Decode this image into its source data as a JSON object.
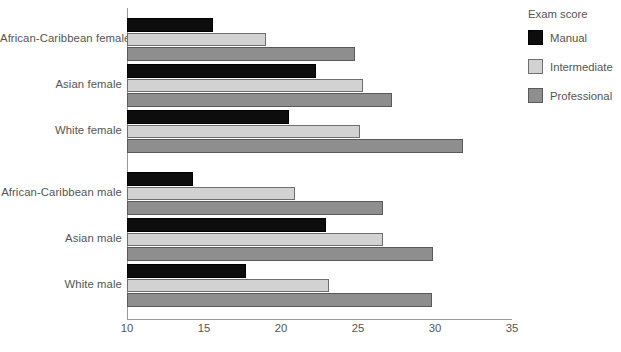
{
  "chart_data": {
    "type": "bar",
    "orientation": "horizontal",
    "title": "",
    "xlabel": "",
    "ylabel": "",
    "xlim": [
      10,
      35
    ],
    "xticks": [
      10,
      15,
      20,
      25,
      30,
      35
    ],
    "grid": false,
    "legend_position": "right",
    "legend_title": "Exam score",
    "categories": [
      "African-Caribbean female",
      "Asian female",
      "White female",
      "African-Caribbean male",
      "Asian male",
      "White male"
    ],
    "series": [
      {
        "name": "Manual",
        "color": "#0d0d0d",
        "values": [
          15.6,
          22.3,
          20.5,
          14.3,
          22.9,
          17.7
        ]
      },
      {
        "name": "Intermediate",
        "color": "#d2d2d2",
        "values": [
          19.0,
          25.3,
          25.1,
          20.9,
          26.6,
          23.1
        ]
      },
      {
        "name": "Professional",
        "color": "#8e8e8e",
        "values": [
          24.8,
          27.2,
          31.8,
          26.6,
          29.9,
          29.8
        ]
      }
    ]
  },
  "legend": {
    "title": "Exam score",
    "items": [
      {
        "label": "Manual",
        "swatch": "manual"
      },
      {
        "label": "Intermediate",
        "swatch": "intermediate"
      },
      {
        "label": "Professional",
        "swatch": "professional"
      }
    ]
  },
  "axis": {
    "x_tick_labels": [
      "10",
      "15",
      "20",
      "25",
      "30",
      "35"
    ],
    "y_tick_labels": [
      "African-Caribbean female",
      "Asian female",
      "White female",
      "African-Caribbean male",
      "Asian male",
      "White male"
    ]
  }
}
